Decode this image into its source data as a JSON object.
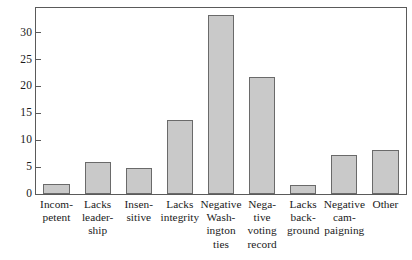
{
  "chart_data": {
    "type": "bar",
    "title": "",
    "subtitle": "",
    "xlabel": "",
    "ylabel": "",
    "ylim": [
      0,
      34.6
    ],
    "yticks": [
      0,
      5,
      10,
      15,
      20,
      25,
      30
    ],
    "ytick_labels": [
      "0",
      "5",
      "10",
      "15",
      "20",
      "25",
      "30"
    ],
    "grid": false,
    "legend": null,
    "categories": [
      "Incom-\npetent",
      "Lacks\nleader-\nship",
      "Insen-\nsitive",
      "Lacks\nintegrity",
      "Negative\nWash-\nington\nties",
      "Nega-\ntive\nvoting\nrecord",
      "Lacks\nback-\nground",
      "Negative\ncam-\npaigning",
      "Other"
    ],
    "categories_plain": [
      "Incompetent",
      "Lacks leadership",
      "Insensitive",
      "Lacks integrity",
      "Negative Washington ties",
      "Negative voting record",
      "Lacks background",
      "Negative campaigning",
      "Other"
    ],
    "values": [
      1.8,
      5.9,
      4.8,
      13.7,
      33.3,
      21.7,
      1.7,
      7.3,
      8.2
    ],
    "bar_color": "#c9c9c9",
    "bar_edge_color": "#6a6a6a",
    "axis_color": "#5a5a5a",
    "background_color": "#ffffff"
  }
}
